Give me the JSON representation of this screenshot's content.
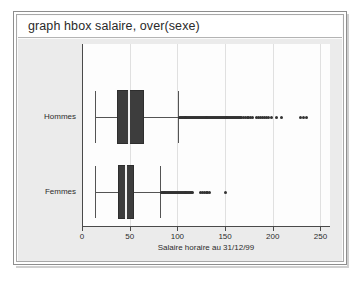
{
  "window": {
    "command": "graph hbox salaire, over(sexe)"
  },
  "chart_data": {
    "type": "boxplot",
    "title": "",
    "xlabel": "Salaire horaire au 31/12/99",
    "ylabel": "",
    "orientation": "horizontal",
    "grid": true,
    "legend": "none",
    "xlim": [
      0,
      260
    ],
    "xticks": [
      0,
      50,
      100,
      150,
      200,
      250
    ],
    "xticklabels": [
      "0",
      "50",
      "100",
      "150",
      "200",
      "250"
    ],
    "categories": [
      "Hommes",
      "Femmes"
    ],
    "boxes": [
      {
        "category": "Hommes",
        "whisker_low": 14,
        "q1": 37,
        "median": 48,
        "q3": 65,
        "whisker_high": 101,
        "outliers": [
          102,
          103,
          104,
          105,
          106,
          107,
          108,
          109,
          110,
          111,
          112,
          113,
          114,
          115,
          116,
          117,
          118,
          119,
          120,
          121,
          122,
          123,
          124,
          125,
          126,
          127,
          128,
          129,
          130,
          131,
          132,
          133,
          134,
          135,
          136,
          137,
          138,
          139,
          140,
          141,
          142,
          143,
          144,
          145,
          146,
          147,
          148,
          149,
          150,
          151,
          152,
          153,
          154,
          155,
          156,
          157,
          158,
          159,
          160,
          161,
          162,
          163,
          164,
          165,
          166,
          167,
          169,
          171,
          173,
          175,
          177,
          179,
          183,
          185,
          187,
          189,
          191,
          193,
          196,
          199,
          204,
          209,
          229,
          232,
          235
        ]
      },
      {
        "category": "Femmes",
        "whisker_low": 14,
        "q1": 38,
        "median": 45,
        "q3": 55,
        "whisker_high": 82,
        "outliers": [
          83,
          84,
          85,
          86,
          87,
          88,
          89,
          90,
          91,
          92,
          93,
          94,
          95,
          96,
          97,
          98,
          99,
          100,
          101,
          102,
          103,
          104,
          105,
          106,
          107,
          108,
          109,
          110,
          111,
          112,
          113,
          114,
          115,
          116,
          124,
          126,
          128,
          130,
          132,
          134,
          150
        ]
      }
    ]
  }
}
